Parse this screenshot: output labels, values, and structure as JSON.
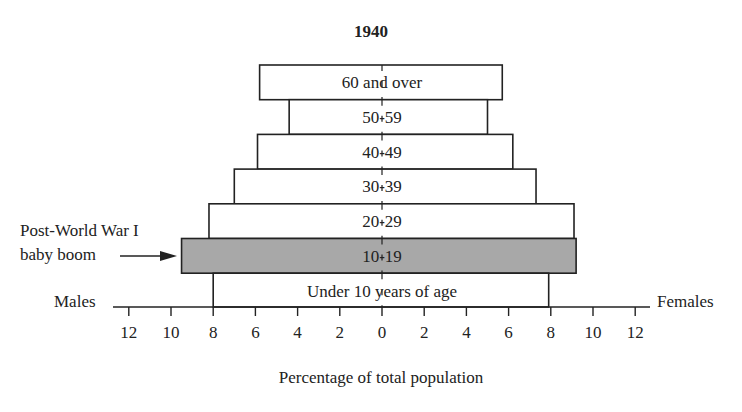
{
  "chart_data": {
    "type": "bar",
    "subtype": "population-pyramid",
    "title": "1940",
    "xlabel": "Percentage of total population",
    "left_label": "Males",
    "right_label": "Females",
    "x_ticks_left": [
      "12",
      "10",
      "8",
      "6",
      "4",
      "2",
      "0"
    ],
    "x_ticks_right": [
      "2",
      "4",
      "6",
      "8",
      "10",
      "12"
    ],
    "xlim": [
      -12,
      12
    ],
    "categories": [
      "60 and over",
      "50-59",
      "40-49",
      "30-39",
      "20-29",
      "10-19",
      "Under 10 years of age"
    ],
    "series": [
      {
        "name": "Males",
        "values": [
          5.8,
          4.4,
          5.9,
          7.0,
          8.2,
          9.5,
          8.0
        ]
      },
      {
        "name": "Females",
        "values": [
          5.7,
          5.0,
          6.2,
          7.3,
          9.1,
          9.2,
          7.9
        ]
      }
    ],
    "highlight": {
      "category": "10-19",
      "color": "#a8a8a8"
    },
    "annotation": {
      "text_line1": "Post-World War I",
      "text_line2": "baby boom",
      "target": "10-19"
    },
    "grid": false
  },
  "colors": {
    "ink": "#222222",
    "bar_fill": "#ffffff",
    "highlight_fill": "#a8a8a8"
  }
}
